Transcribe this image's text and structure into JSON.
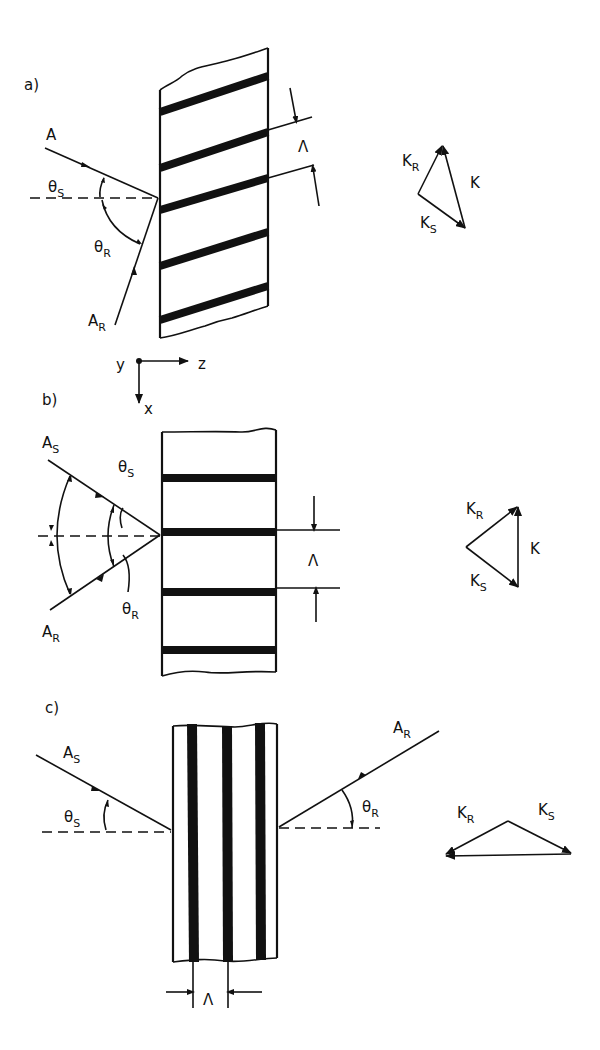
{
  "figure": {
    "panels": [
      {
        "id": "a",
        "label": "a)",
        "incident_beam": {
          "name": "A",
          "subscript": ""
        },
        "reference_beam": {
          "name": "A",
          "subscript": "R"
        },
        "angle_signal": {
          "symbol": "θ",
          "subscript": "S"
        },
        "angle_reference": {
          "symbol": "θ",
          "subscript": "R"
        },
        "grating_period": "Λ",
        "fringes": "slanted",
        "k_diagram": {
          "vectors": [
            {
              "name": "K",
              "subscript": "R"
            },
            {
              "name": "K",
              "subscript": ""
            },
            {
              "name": "K",
              "subscript": "S"
            }
          ]
        }
      },
      {
        "id": "b",
        "label": "b)",
        "incident_beam": {
          "name": "A",
          "subscript": "S"
        },
        "reference_beam": {
          "name": "A",
          "subscript": "R"
        },
        "angle_signal": {
          "symbol": "θ",
          "subscript": "S"
        },
        "angle_reference": {
          "symbol": "θ",
          "subscript": "R"
        },
        "grating_period": "Λ",
        "fringes": "unslanted, parallel to surface normal",
        "k_diagram": {
          "vectors": [
            {
              "name": "K",
              "subscript": "R"
            },
            {
              "name": "K",
              "subscript": ""
            },
            {
              "name": "K",
              "subscript": "S"
            }
          ]
        }
      },
      {
        "id": "c",
        "label": "c)",
        "incident_beam": {
          "name": "A",
          "subscript": "S"
        },
        "reference_beam": {
          "name": "A",
          "subscript": "R"
        },
        "angle_signal": {
          "symbol": "θ",
          "subscript": "S"
        },
        "angle_reference": {
          "symbol": "θ",
          "subscript": "R"
        },
        "grating_period": "Λ",
        "fringes": "perpendicular to surface (reflection geometry)",
        "k_diagram": {
          "vectors": [
            {
              "name": "K",
              "subscript": "R"
            },
            {
              "name": "K",
              "subscript": "S"
            }
          ]
        }
      }
    ],
    "axes": {
      "y": "y",
      "z": "z",
      "x": "x"
    }
  }
}
